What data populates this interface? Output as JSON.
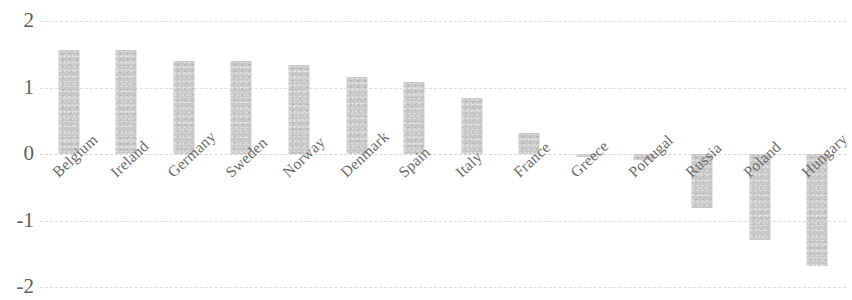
{
  "chart_data": {
    "type": "bar",
    "title": "",
    "subtitle": "",
    "xlabel": "",
    "ylabel": "",
    "ylim": [
      -2,
      2
    ],
    "yticks": [
      2,
      1,
      0,
      -1,
      -2
    ],
    "ytick_labels": [
      "2",
      "1",
      "0",
      "-1",
      "-2"
    ],
    "grid": true,
    "legend": false,
    "legend_position": "none",
    "bar_color": "#c9c9c9",
    "categories": [
      "Belgium",
      "Ireland",
      "Germany",
      "Sweden",
      "Norway",
      "Denmark",
      "Spain",
      "Italy",
      "France",
      "Greece",
      "Portugal",
      "Russia",
      "Poland",
      "Hungary"
    ],
    "values": [
      1.56,
      1.56,
      1.4,
      1.4,
      1.34,
      1.16,
      1.08,
      0.84,
      0.32,
      -0.05,
      -0.09,
      -0.81,
      -1.29,
      -1.68
    ]
  }
}
